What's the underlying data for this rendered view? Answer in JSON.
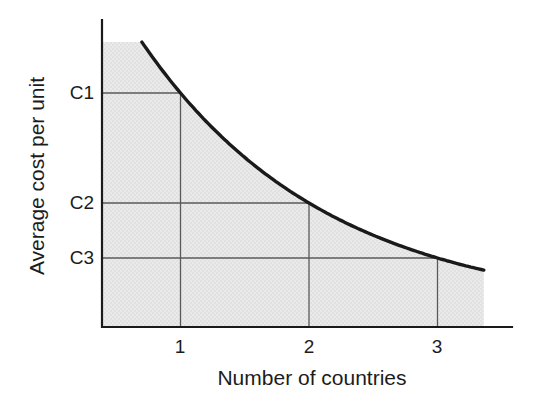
{
  "chart_data": {
    "type": "line",
    "title": "",
    "xlabel": "Number of countries",
    "ylabel": "Average cost per unit",
    "x_tick_labels": [
      "1",
      "2",
      "3"
    ],
    "y_tick_labels": [
      "C1",
      "C2",
      "C3"
    ],
    "points": [
      {
        "x": 1,
        "y_label": "C1",
        "y_rel_height": 0.76
      },
      {
        "x": 2,
        "y_label": "C2",
        "y_rel_height": 0.4
      },
      {
        "x": 3,
        "y_label": "C3",
        "y_rel_height": 0.22
      }
    ],
    "curve": {
      "shape": "convex decreasing (economies of scale: average cost per unit falls as number of countries increases)",
      "x_start": 0.7,
      "x_end": 3.36,
      "y_rel_start": 0.93,
      "y_rel_end": 0.19
    },
    "area_fill": "region between curve and axes shaded with gray halftone dots",
    "gridlines": "reference drop-lines from each curve point to the x-axis and y-axis",
    "ylim_labels": "unnumbered axis, C1 > C2 > C3",
    "colors": {
      "curve": "#1a1a1a",
      "axes": "#1a1a1a",
      "reference_lines": "#5a5a5a",
      "shade_base": "#eaeaea",
      "shade_dots": "#d4d4d4",
      "text": "#1c1c1c",
      "background": "#ffffff"
    }
  }
}
